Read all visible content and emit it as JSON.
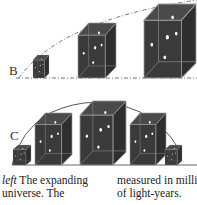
{
  "figure": {
    "panels": [
      {
        "label": "B",
        "line_style": "dashed",
        "cube_count": 3,
        "cube_sizes": [
          "small",
          "medium",
          "large"
        ]
      },
      {
        "label": "C",
        "line_style": "solid",
        "cube_count": 5,
        "cube_sizes": [
          "tiny",
          "medium",
          "large",
          "medium",
          "tiny"
        ]
      }
    ],
    "colors": {
      "cube_fill": "#3a3a3a",
      "cube_edge": "#9a9a9a",
      "dot": "#ffffff",
      "line": "#555555"
    }
  },
  "caption": {
    "left": {
      "italic_lead": "left",
      "line1_rest": " The expanding",
      "line2": "universe. The"
    },
    "right": {
      "line1": "measured in milli",
      "line2": "of light-years."
    }
  }
}
